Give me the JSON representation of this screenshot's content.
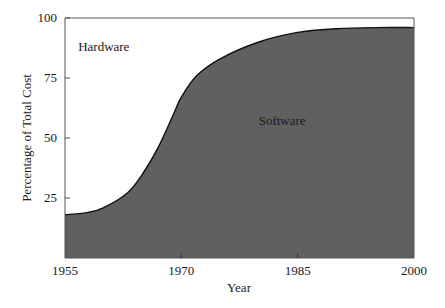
{
  "chart_data": {
    "type": "area",
    "title": "",
    "xlabel": "Year",
    "ylabel": "Percentage of Total Cost",
    "xlim": [
      1955,
      2000
    ],
    "ylim": [
      0,
      100
    ],
    "x_ticks": [
      1955,
      1970,
      1985,
      2000
    ],
    "x_tick_labels": [
      "1955",
      "1970",
      "1985",
      "2000"
    ],
    "y_ticks": [
      25,
      50,
      75,
      100
    ],
    "y_tick_labels": [
      "25",
      "50",
      "75",
      "100"
    ],
    "grid": false,
    "legend": null,
    "series": [
      {
        "name": "Software",
        "x": [
          1955,
          1958,
          1960,
          1963,
          1965,
          1967,
          1969,
          1970,
          1972,
          1975,
          1980,
          1985,
          1990,
          1995,
          2000
        ],
        "values": [
          18,
          19,
          21,
          27,
          35,
          46,
          60,
          67,
          76,
          83,
          90,
          94,
          95.5,
          96,
          96
        ],
        "fill": "#606060"
      }
    ],
    "annotations": [
      {
        "text": "Hardware",
        "x": 1960,
        "y": 88,
        "region": "above-curve"
      },
      {
        "text": "Software",
        "x": 1983,
        "y": 57,
        "region": "below-curve"
      }
    ]
  },
  "colors": {
    "fill": "#606060",
    "line": "#111111",
    "axis": "#555555",
    "background": "#ffffff"
  }
}
